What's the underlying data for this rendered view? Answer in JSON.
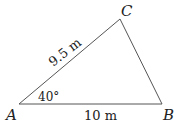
{
  "diagram": {
    "type": "triangle",
    "vertices": {
      "A": {
        "label": "A"
      },
      "B": {
        "label": "B"
      },
      "C": {
        "label": "C"
      }
    },
    "sides": {
      "AC": {
        "label": "9.5 m"
      },
      "AB": {
        "label": "10 m"
      }
    },
    "angles": {
      "A": {
        "label": "40°"
      }
    },
    "colors": {
      "stroke": "#555555",
      "text": "#222222"
    }
  }
}
